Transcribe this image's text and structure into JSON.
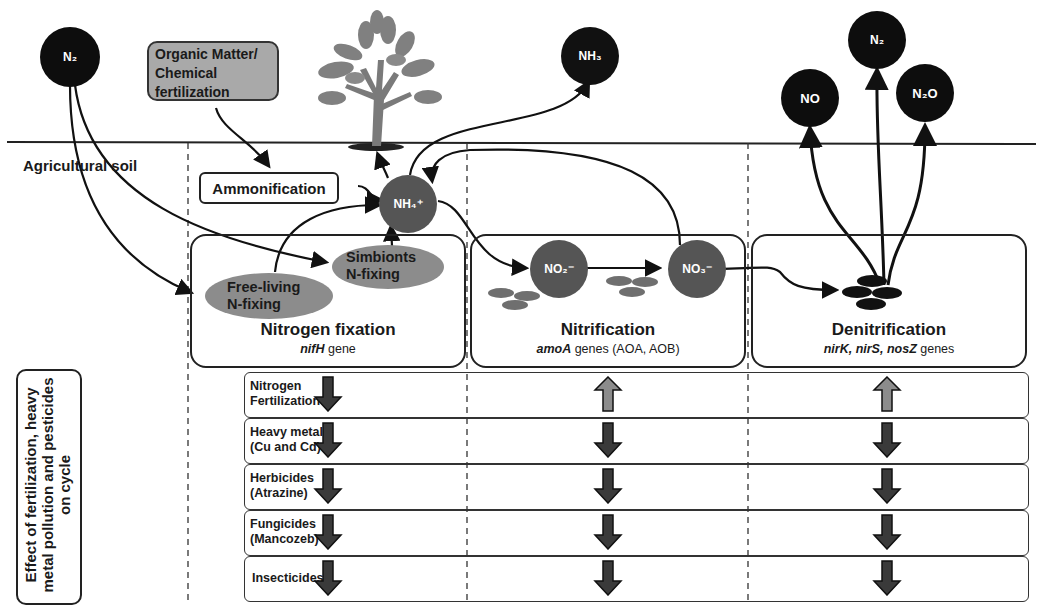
{
  "atmosphere": {
    "n2_left": "N₂",
    "nh3": "NH₃",
    "no": "NO",
    "n2_right": "N₂",
    "n2o": "N₂O"
  },
  "inputs": {
    "organic_matter": "Organic Matter/ Chemical fertilization",
    "organic_matter_lines": [
      "Organic Matter/",
      "Chemical",
      "fertilization"
    ],
    "ammonification": "Ammonification"
  },
  "soil_label": "Agricultural soil",
  "nodes": {
    "nh4": "NH₄⁺",
    "no2": "NO₂⁻",
    "no3": "NO₃⁻",
    "free_living": [
      "Free-living",
      "N-fixing"
    ],
    "symbionts": [
      "Simbionts",
      "N-fixing"
    ]
  },
  "processes": [
    {
      "title": "Nitrogen fixation",
      "gene_italic": "nifH",
      "gene_rest": " gene"
    },
    {
      "title": "Nitrification",
      "gene_italic": "amoA",
      "gene_rest": " genes  (AOA, AOB)"
    },
    {
      "title": "Denitrification",
      "gene_italic": "nirK, nirS, nosZ",
      "gene_rest": " genes"
    }
  ],
  "effects": {
    "side_label": "Effect of fertilization, heavy metal pollution and pesticides on cycle",
    "legend": {
      "down": "decrease",
      "up": "increase"
    },
    "colors": {
      "down": "#3a3a3a",
      "up": "#8c8c8c"
    },
    "rows": [
      {
        "label": [
          "Nitrogen",
          "Fertilization"
        ],
        "effects": [
          "down",
          "up",
          "up"
        ]
      },
      {
        "label": [
          "Heavy metal",
          "(Cu and Cd)"
        ],
        "effects": [
          "down",
          "down",
          "down"
        ]
      },
      {
        "label": [
          "Herbicides",
          "(Atrazine)"
        ],
        "effects": [
          "down",
          "down",
          "down"
        ]
      },
      {
        "label": [
          "Fungicides",
          "(Mancozeb)"
        ],
        "effects": [
          "down",
          "down",
          "down"
        ]
      },
      {
        "label": [
          "Insecticides"
        ],
        "effects": [
          "down",
          "down",
          "down"
        ]
      }
    ]
  }
}
